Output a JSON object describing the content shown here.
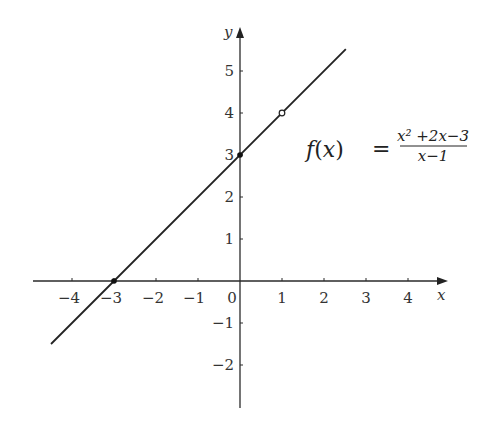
{
  "chart_data": {
    "type": "line",
    "title": "",
    "xlabel": "x",
    "ylabel": "y",
    "xlim": [
      -4.5,
      4.7
    ],
    "ylim": [
      -3,
      5.9
    ],
    "x_ticks": [
      -4,
      -3,
      -2,
      -1,
      0,
      1,
      2,
      3,
      4
    ],
    "x_tick_labels": [
      "−4",
      "−3",
      "−2",
      "−1",
      "0",
      "1",
      "2",
      "3",
      "4"
    ],
    "y_ticks": [
      -2,
      -1,
      1,
      2,
      3,
      4,
      5
    ],
    "y_tick_labels": [
      "−2",
      "−1",
      "1",
      "2",
      "3",
      "4",
      "5"
    ],
    "grid": false,
    "series": [
      {
        "name": "f(x) = (x^2+2x-3)/(x-1)",
        "x": [
          -4.5,
          2.52
        ],
        "y": [
          -1.5,
          5.52
        ],
        "color": "#222222"
      }
    ],
    "points": [
      {
        "label": "x-intercept",
        "x": -3,
        "y": 0,
        "style": "filled"
      },
      {
        "label": "y-intercept",
        "x": 0,
        "y": 3,
        "style": "filled"
      },
      {
        "label": "hole",
        "x": 1,
        "y": 4,
        "style": "open"
      }
    ],
    "annotation": {
      "lhs_f": "f",
      "lhs_open": "(",
      "lhs_x": "x",
      "lhs_close": ")",
      "equals": "=",
      "numerator": "x² +2x−3",
      "denominator": "x−1"
    }
  }
}
